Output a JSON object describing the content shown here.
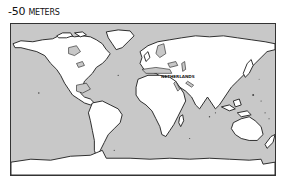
{
  "caption": {
    "sign": "-",
    "value": "50",
    "unit": "METERS"
  },
  "map": {
    "ocean_color": "#c8c8c8",
    "land_color": "#ffffff",
    "coast_color": "#1a1a1a",
    "labels": [
      {
        "text": "NETHERLANDS"
      }
    ]
  }
}
